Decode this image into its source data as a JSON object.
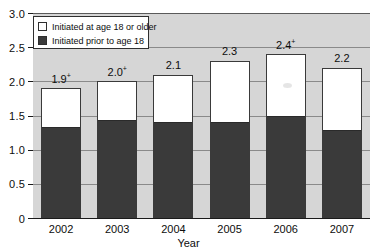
{
  "chart_data": {
    "type": "bar",
    "subtype": "stacked-vertical",
    "title": "",
    "xlabel": "Year",
    "ylabel": "",
    "categories": [
      "2002",
      "2003",
      "2004",
      "2005",
      "2006",
      "2007"
    ],
    "series": [
      {
        "name": "Initiated prior to age 18",
        "color": "#3a3a3a",
        "values": [
          1.3,
          1.4,
          1.38,
          1.38,
          1.46,
          1.26
        ]
      },
      {
        "name": "Initiated at age 18 or older",
        "color": "#ffffff",
        "values": [
          0.6,
          0.6,
          0.72,
          0.92,
          0.94,
          0.94
        ]
      }
    ],
    "totals": [
      1.9,
      2.0,
      2.1,
      2.3,
      2.4,
      2.2
    ],
    "total_labels": [
      "1.9",
      "2.0",
      "2.1",
      "2.3",
      "2.4",
      "2.2"
    ],
    "total_label_markers": [
      "+",
      "+",
      "",
      "",
      "+",
      ""
    ],
    "ylim": [
      0,
      3.0
    ],
    "yticks": [
      0,
      0.5,
      1.0,
      1.5,
      2.0,
      2.5,
      3.0
    ],
    "ytick_labels": [
      "0",
      "0.5",
      "1.0",
      "1.5",
      "2.0",
      "2.5",
      "3.0"
    ],
    "grid": true,
    "grid_axis": "y",
    "legend_position": "top-left",
    "legend_entries": [
      "Initiated at age 18 or older",
      "Initiated prior to age 18"
    ],
    "plot_background": "#d6d6d6"
  },
  "axes": {
    "x_title": "Year",
    "x_categories": [
      "2002",
      "2003",
      "2004",
      "2005",
      "2006",
      "2007"
    ],
    "y_tick_labels": [
      "3.0",
      "2.5",
      "2.0",
      "1.5",
      "1.0",
      "0.5",
      "0"
    ]
  },
  "legend": {
    "items": [
      {
        "label": "Initiated at age 18 or older",
        "swatch": "light"
      },
      {
        "label": "Initiated prior to age 18",
        "swatch": "dark"
      }
    ]
  },
  "bars": [
    {
      "year": "2002",
      "label": "1.9",
      "marker": "+",
      "total": 1.9,
      "lower": 1.3,
      "upper": 0.6
    },
    {
      "year": "2003",
      "label": "2.0",
      "marker": "+",
      "total": 2.0,
      "lower": 1.4,
      "upper": 0.6
    },
    {
      "year": "2004",
      "label": "2.1",
      "marker": "",
      "total": 2.1,
      "lower": 1.38,
      "upper": 0.72
    },
    {
      "year": "2005",
      "label": "2.3",
      "marker": "",
      "total": 2.3,
      "lower": 1.38,
      "upper": 0.92
    },
    {
      "year": "2006",
      "label": "2.4",
      "marker": "+",
      "total": 2.4,
      "lower": 1.46,
      "upper": 0.94
    },
    {
      "year": "2007",
      "label": "2.2",
      "marker": "",
      "total": 2.2,
      "lower": 1.26,
      "upper": 0.94
    }
  ]
}
